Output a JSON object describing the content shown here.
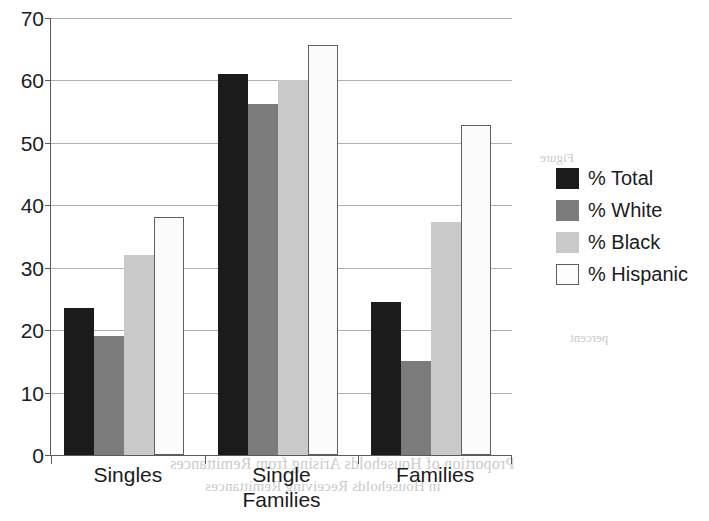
{
  "chart_data": {
    "type": "bar",
    "title": "",
    "subtitle": "",
    "xlabel": "",
    "ylabel": "",
    "categories": [
      "Singles",
      "Single\nFamilies",
      "Families"
    ],
    "series": [
      {
        "name": "% Total",
        "color": "#1b1b1b",
        "values": [
          23.5,
          61.0,
          24.5
        ]
      },
      {
        "name": "% White",
        "color": "#7b7b7b",
        "values": [
          19.0,
          56.2,
          15.0
        ]
      },
      {
        "name": "% Black",
        "color": "#c9c9c9",
        "values": [
          32.0,
          60.0,
          37.4
        ]
      },
      {
        "name": "% Hispanic",
        "color": "#fbfbfb",
        "values": [
          38.2,
          65.6,
          52.8
        ]
      }
    ],
    "ylim": [
      0,
      70
    ],
    "yticks": [
      0,
      10,
      20,
      30,
      40,
      50,
      60,
      70
    ],
    "ytick_labels": [
      "0",
      "10",
      "20",
      "30",
      "40",
      "50",
      "60",
      "70"
    ],
    "grid": true,
    "grid_axis": "y",
    "legend_position": "right",
    "legend_entries": [
      "% Total",
      "% White",
      "% Black",
      "% Hispanic"
    ]
  },
  "legend": {
    "items": [
      {
        "label": "% Total",
        "swatch": "total"
      },
      {
        "label": "% White",
        "swatch": "white"
      },
      {
        "label": "% Black",
        "swatch": "black"
      },
      {
        "label": "% Hispanic",
        "swatch": "hispanic"
      }
    ]
  },
  "axes": {
    "y_labels": [
      "70",
      "60",
      "50",
      "40",
      "30",
      "20",
      "10",
      "0"
    ],
    "x_labels": [
      "Singles",
      "Single\nFamilies",
      "Families"
    ]
  },
  "scan_bleed": {
    "line_1": "Proportion of Households Arising from Remittances",
    "line_2": "in Households Receiving Remittances",
    "line_3": "Figure",
    "line_4": "percent",
    "line_5": "Source",
    "line_6": "survey data"
  }
}
